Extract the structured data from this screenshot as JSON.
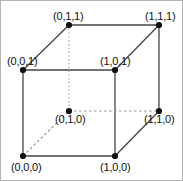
{
  "figure": {
    "width": 183,
    "height": 181,
    "background_color": "#ffffff",
    "border_color": "#b4b4b4",
    "edge_color": "#444444",
    "hidden_edge_color": "#9a9a9a",
    "vertex_color": "#111111",
    "label_color": "#111111"
  },
  "vertices": [
    {
      "id": "v-000",
      "label": "(0,0,0)",
      "coord": [
        0,
        0,
        0
      ],
      "x": 22,
      "y": 155,
      "hidden": false,
      "label_x": 10,
      "label_y": 160
    },
    {
      "id": "v-100",
      "label": "(1,0,0)",
      "coord": [
        1,
        0,
        0
      ],
      "x": 114,
      "y": 155,
      "hidden": false,
      "label_x": 99,
      "label_y": 160
    },
    {
      "id": "v-001",
      "label": "(0,0,1)",
      "coord": [
        0,
        0,
        1
      ],
      "x": 22,
      "y": 69,
      "hidden": false,
      "label_x": 6,
      "label_y": 54
    },
    {
      "id": "v-101",
      "label": "(1,0,1)",
      "coord": [
        1,
        0,
        1
      ],
      "x": 114,
      "y": 69,
      "hidden": false,
      "label_x": 99,
      "label_y": 54
    },
    {
      "id": "v-011",
      "label": "(0,1,1)",
      "coord": [
        0,
        1,
        1
      ],
      "x": 68,
      "y": 24,
      "hidden": false,
      "label_x": 52,
      "label_y": 9
    },
    {
      "id": "v-111",
      "label": "(1,1,1)",
      "coord": [
        1,
        1,
        1
      ],
      "x": 158,
      "y": 24,
      "hidden": false,
      "label_x": 144,
      "label_y": 9
    },
    {
      "id": "v-010",
      "label": "(0,1,0)",
      "coord": [
        0,
        1,
        0
      ],
      "x": 68,
      "y": 110,
      "hidden": true,
      "label_x": 54,
      "label_y": 112
    },
    {
      "id": "v-110",
      "label": "(1,1,0)",
      "coord": [
        1,
        1,
        0
      ],
      "x": 158,
      "y": 110,
      "hidden": true,
      "label_x": 143,
      "label_y": 112
    }
  ],
  "edges": [
    {
      "id": "edge-front-top",
      "from": "v-001",
      "to": "v-101",
      "style": "solid"
    },
    {
      "id": "edge-front-right",
      "from": "v-101",
      "to": "v-100",
      "style": "solid"
    },
    {
      "id": "edge-front-bottom",
      "from": "v-000",
      "to": "v-100",
      "style": "solid"
    },
    {
      "id": "edge-front-left",
      "from": "v-001",
      "to": "v-000",
      "style": "solid"
    },
    {
      "id": "edge-back-top",
      "from": "v-011",
      "to": "v-111",
      "style": "solid"
    },
    {
      "id": "edge-back-right",
      "from": "v-111",
      "to": "v-110",
      "style": "solid"
    },
    {
      "id": "edge-depth-top-left",
      "from": "v-001",
      "to": "v-011",
      "style": "solid"
    },
    {
      "id": "edge-depth-top-right",
      "from": "v-101",
      "to": "v-111",
      "style": "solid"
    },
    {
      "id": "edge-depth-bottom-right",
      "from": "v-100",
      "to": "v-110",
      "style": "solid"
    },
    {
      "id": "edge-back-left-hidden",
      "from": "v-011",
      "to": "v-010",
      "style": "dotted"
    },
    {
      "id": "edge-back-bottom-hidden",
      "from": "v-010",
      "to": "v-110",
      "style": "dashed"
    },
    {
      "id": "edge-depth-bottom-left-hidden",
      "from": "v-000",
      "to": "v-010",
      "style": "dashed"
    }
  ]
}
